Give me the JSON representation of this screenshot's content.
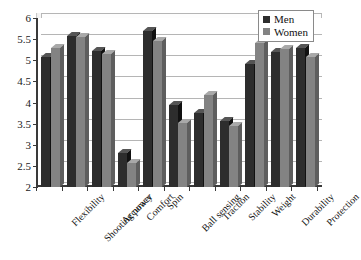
{
  "chart_data": {
    "type": "bar",
    "title": "",
    "subtitle": "",
    "xlabel": "",
    "ylabel": "",
    "ylim": [
      2,
      6
    ],
    "ytick_step": 0.5,
    "yticks": [
      "6",
      "5.5",
      "5",
      "4.5",
      "4",
      "3.5",
      "3",
      "2.5",
      "2"
    ],
    "grid": true,
    "legend_position": "top-right",
    "categories": [
      "Flexibility",
      "Shooting power",
      "Accuracy",
      "Comfort",
      "Spin",
      "Ball sensing",
      "Traction",
      "Stability",
      "Weight",
      "Durability",
      "Protection"
    ],
    "series": [
      {
        "name": "Men",
        "color": "#2d2d2d",
        "values": [
          5.07,
          5.57,
          5.22,
          2.8,
          5.7,
          3.95,
          3.75,
          3.57,
          4.92,
          5.2,
          5.28
        ]
      },
      {
        "name": "Women",
        "color": "#838383",
        "values": [
          5.28,
          5.55,
          5.15,
          2.57,
          5.45,
          3.52,
          4.17,
          3.45,
          5.42,
          5.27,
          5.07
        ]
      }
    ]
  },
  "legend": {
    "items": [
      {
        "label": "Men",
        "color": "#2d2d2d"
      },
      {
        "label": "Women",
        "color": "#838383"
      }
    ]
  },
  "colors": {
    "men": "#2d2d2d",
    "women": "#838383",
    "grid": "#b5b5b5",
    "axis": "#3a3a3a",
    "background": "#ffffff"
  }
}
